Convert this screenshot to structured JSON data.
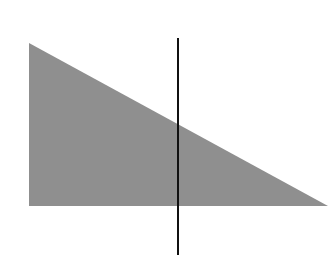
{
  "diagram": {
    "shapes": [
      {
        "type": "right-triangle",
        "points": [
          [
            29,
            43
          ],
          [
            29,
            206
          ],
          [
            328,
            206
          ]
        ],
        "fill": "#8f8f8f"
      },
      {
        "type": "vertical-line",
        "x": 178,
        "y1": 38,
        "y2": 255,
        "stroke": "#111111",
        "width": 2
      }
    ],
    "background": "#ffffff"
  }
}
